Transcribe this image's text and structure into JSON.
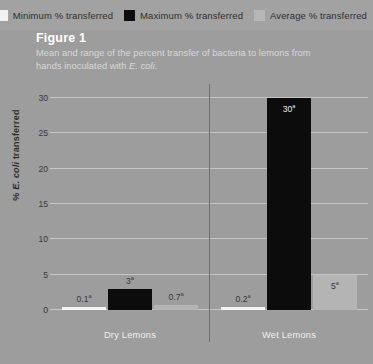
{
  "legend": {
    "items": [
      {
        "label": "Minimum % transferred",
        "color": "#f2f2f2",
        "icon": "legend-swatch-minimum"
      },
      {
        "label": "Maximum % transferred",
        "color": "#0d0d0d",
        "icon": "legend-swatch-maximum"
      },
      {
        "label": "Average % transferred",
        "color": "#b6b6b6",
        "icon": "legend-swatch-average"
      }
    ]
  },
  "figure": {
    "number": "Figure 1",
    "caption_part1": "Mean and range of the percent transfer of bacteria to lemons from hands inoculated with ",
    "caption_italic": "E. coli",
    "caption_part2": "."
  },
  "chart_data": {
    "type": "bar",
    "title": "Mean and range of the percent transfer of bacteria to lemons from hands inoculated with E. coli.",
    "xlabel": "",
    "ylabel": "% E. coli transferred",
    "ylim": [
      0,
      32
    ],
    "yticks": [
      0,
      5,
      10,
      15,
      20,
      25,
      30
    ],
    "grid": true,
    "legend_position": "top-right",
    "categories": [
      "Dry Lemons",
      "Wet Lemons"
    ],
    "series": [
      {
        "name": "Minimum % transferred",
        "color": "#f4f4f4",
        "values": [
          0.1,
          0.2
        ],
        "labels": [
          "0.1",
          "0.2"
        ],
        "label_superscripts": [
          "a",
          "a"
        ]
      },
      {
        "name": "Maximum % transferred",
        "color": "#0c0c0c",
        "values": [
          3,
          30
        ],
        "labels": [
          "3",
          "30"
        ],
        "label_superscripts": [
          "a",
          "a"
        ]
      },
      {
        "name": "Average % transferred",
        "color": "#b4b4b4",
        "values": [
          0.7,
          5
        ],
        "labels": [
          "0.7",
          "5"
        ],
        "label_superscripts": [
          "a",
          "a"
        ]
      }
    ]
  },
  "axis": {
    "ticklabels": [
      "0",
      "5",
      "10",
      "15",
      "20",
      "25",
      "30"
    ],
    "ylabel_prefix": "% ",
    "ylabel_italic": "E. coli",
    "ylabel_suffix": " transferred"
  }
}
